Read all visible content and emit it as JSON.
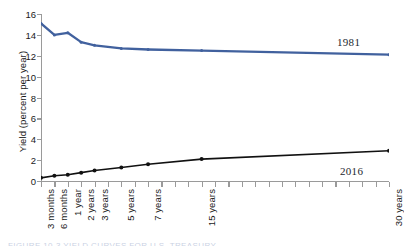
{
  "figure": {
    "background": "#ffffff",
    "caption_partial": "FIGURE 10-3   YIELD CURVES FOR U.S. TREASURY"
  },
  "chart_data": {
    "type": "line",
    "title": "",
    "xlabel": "",
    "ylabel": "Yield (percent per year)",
    "ylim": [
      0,
      16
    ],
    "yticks": [
      0,
      2,
      4,
      6,
      8,
      10,
      12,
      14,
      16
    ],
    "grid": false,
    "legend_position": "inline-right-annotations",
    "categories": [
      "3 months",
      "6 months",
      "1 year",
      "2 years",
      "3 years",
      "5 years",
      "7 years",
      "15 years",
      "30 years"
    ],
    "category_positions": [
      0,
      1,
      2,
      3,
      4,
      6,
      8,
      12,
      26
    ],
    "axis_tick_count": 27,
    "series": [
      {
        "name": "1981",
        "color": "#41619e",
        "marker": "diamond",
        "values": [
          15.1,
          14.0,
          14.2,
          13.3,
          13.0,
          12.7,
          12.6,
          12.5,
          12.1
        ]
      },
      {
        "name": "2016",
        "color": "#111111",
        "marker": "circle",
        "values": [
          0.3,
          0.5,
          0.6,
          0.8,
          1.0,
          1.3,
          1.6,
          2.1,
          2.9
        ]
      }
    ],
    "annotations": [
      {
        "text": "1981",
        "series": "1981"
      },
      {
        "text": "2016",
        "series": "2016"
      }
    ]
  }
}
